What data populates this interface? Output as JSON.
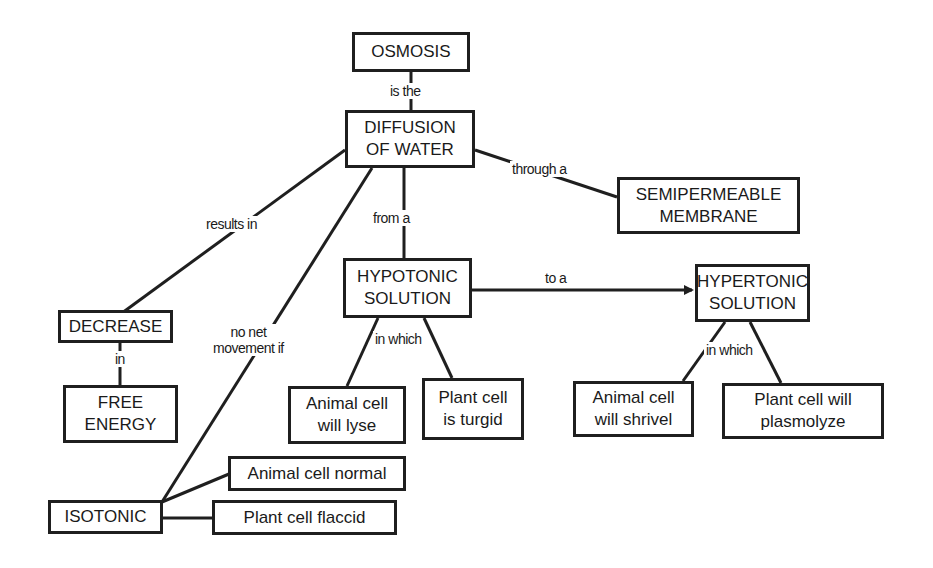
{
  "concept_map": {
    "title": "Osmosis concept map",
    "nodes": {
      "osmosis": "OSMOSIS",
      "diffusion": "DIFFUSION\nOF WATER",
      "semipermeable": "SEMIPERMEABLE\nMEMBRANE",
      "hypotonic": "HYPOTONIC\nSOLUTION",
      "hypertonic": "HYPERTONIC\nSOLUTION",
      "decrease": "DECREASE",
      "free_energy": "FREE\nENERGY",
      "animal_lyse": "Animal cell\nwill lyse",
      "plant_turgid": "Plant cell\nis turgid",
      "animal_shrivel": "Animal cell\nwill shrivel",
      "plant_plasmolyze": "Plant cell will\nplasmolyze",
      "animal_normal": "Animal cell normal",
      "isotonic": "ISOTONIC",
      "plant_flaccid": "Plant cell flaccid"
    },
    "links": {
      "is_the": "is the",
      "through_a": "through a",
      "from_a": "from a",
      "results_in": "results in",
      "to_a": "to a",
      "in": "in",
      "no_net": "no net\nmovement if",
      "in_which_hypo": "in which",
      "in_which_hyper": "in which"
    }
  }
}
